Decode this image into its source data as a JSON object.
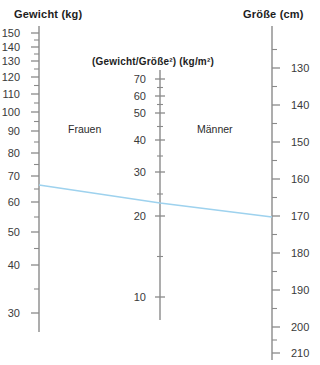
{
  "headers": {
    "left": "Gewicht (kg)",
    "center": "(Gewicht/Größe²) (kg/m²)",
    "right": "Größe (cm)"
  },
  "groups": {
    "female": "Frauen",
    "male": "Männer"
  },
  "chart_data": {
    "type": "line",
    "subtitle": "",
    "xlabel": "",
    "ylabel": "",
    "grid": false,
    "legend": "none",
    "axes": [
      {
        "name": "weight",
        "title": "Gewicht (kg)",
        "unit": "kg",
        "position": "left",
        "scale": "log",
        "orientation": "descending",
        "range": [
          28,
          155
        ],
        "tick_labels": [
          150,
          140,
          130,
          120,
          110,
          100,
          90,
          80,
          70,
          60,
          50,
          40,
          30
        ],
        "minor_ticks": [
          145,
          135,
          125,
          115,
          105,
          95,
          85,
          75,
          65,
          55,
          45,
          35
        ],
        "pixel_positions": {
          "150": 33,
          "140": 47,
          "130": 61,
          "120": 77,
          "110": 94,
          "100": 112,
          "90": 131,
          "80": 153,
          "70": 176,
          "60": 202,
          "50": 232,
          "40": 265,
          "30": 313
        }
      },
      {
        "name": "bmi",
        "title": "(Gewicht/Größe²) (kg/m²)",
        "unit": "kg/m2",
        "position": "center",
        "scale": "log",
        "orientation": "descending",
        "range": [
          8,
          72
        ],
        "tick_labels": [
          70,
          60,
          50,
          40,
          30,
          20,
          10
        ],
        "minor_ticks": [
          65,
          55,
          45,
          35,
          25,
          15
        ],
        "pixel_positions": {
          "70": 79,
          "60": 96,
          "50": 113,
          "40": 140,
          "30": 172,
          "20": 216,
          "10": 297
        }
      },
      {
        "name": "height",
        "title": "Größe (cm)",
        "unit": "cm",
        "position": "right",
        "scale": "linear",
        "orientation": "descending",
        "range": [
          125,
          212
        ],
        "tick_labels": [
          130,
          140,
          150,
          160,
          170,
          180,
          190,
          200,
          210
        ],
        "minor_ticks": [
          125,
          135,
          145,
          155,
          165,
          175,
          185,
          195,
          205
        ],
        "pixel_positions": {
          "130": 68,
          "140": 105,
          "150": 142,
          "160": 179,
          "170": 216,
          "180": 253,
          "190": 290,
          "200": 327,
          "210": 353
        }
      }
    ],
    "annotations": [
      {
        "text": "Frauen",
        "axis": "bmi",
        "side": "left",
        "x_px": 68,
        "y_px": 129
      },
      {
        "text": "Männer",
        "axis": "bmi",
        "side": "right",
        "x_px": 197,
        "y_px": 129
      }
    ],
    "series": [
      {
        "name": "Beispiel-Verbindungslinie",
        "color": "#9ed2ee",
        "points": [
          {
            "axis": "weight",
            "value": 65,
            "x_px": 39,
            "y_px": 185
          },
          {
            "axis": "bmi",
            "value": 22,
            "x_px": 160,
            "y_px": 203
          },
          {
            "axis": "height",
            "value": 170,
            "x_px": 272,
            "y_px": 217
          }
        ]
      }
    ]
  },
  "colors": {
    "line": "#9ed2ee",
    "axis": "#8a8a8a",
    "text": "#2b2b2b",
    "background": "#ffffff"
  }
}
